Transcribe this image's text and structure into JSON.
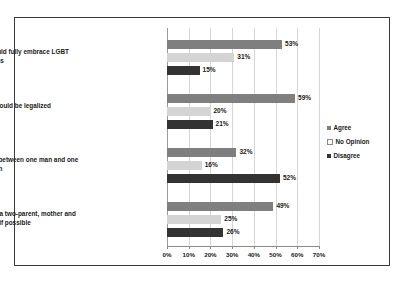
{
  "chart_data": {
    "type": "bar",
    "orientation": "horizontal",
    "title": "",
    "xlabel": "",
    "ylabel": "",
    "xlim": [
      0,
      70
    ],
    "xticks": [
      "0%",
      "10%",
      "20%",
      "30%",
      "40%",
      "50%",
      "60%",
      "70%"
    ],
    "xtick_values": [
      0,
      10,
      20,
      30,
      40,
      50,
      60,
      70
    ],
    "grid": true,
    "legend_position": "right",
    "categories": [
      "Religious communities should fully embrace LGBT persons",
      "Same sex marriage should be legalized",
      "Marriage is only a relationship between one man and one woman",
      "Children ought to be raised in a two-parent, mother and father families, if possible"
    ],
    "series": [
      {
        "name": "Agree",
        "color": "#7f7f7f",
        "values": [
          53,
          59,
          32,
          49
        ],
        "labels": [
          "53%",
          "59%",
          "32%",
          "49%"
        ]
      },
      {
        "name": "No Opinion",
        "color": "#d4d4d4",
        "values": [
          31,
          20,
          16,
          25
        ],
        "labels": [
          "31%",
          "20%",
          "16%",
          "25%"
        ]
      },
      {
        "name": "Disagree",
        "color": "#333333",
        "values": [
          15,
          21,
          52,
          26
        ],
        "labels": [
          "15%",
          "21%",
          "52%",
          "26%"
        ]
      }
    ]
  },
  "legend": {
    "items": [
      {
        "label": "Agree"
      },
      {
        "label": "No Opinion"
      },
      {
        "label": "Disagree"
      }
    ]
  }
}
